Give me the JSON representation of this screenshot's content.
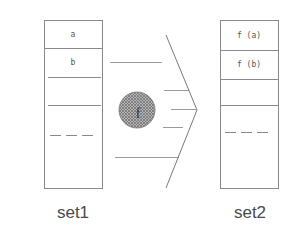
{
  "diagram": {
    "type": "function-mapping",
    "colors": {
      "line": "#8a8a8a",
      "text": "#4a4a4a",
      "circle_fill": "#9a9a9a",
      "background": "#ffffff"
    },
    "source_set": {
      "label": "set1",
      "cells": [
        "a",
        "b",
        "",
        "",
        "..."
      ]
    },
    "target_set": {
      "label": "set2",
      "cells": [
        "f (a)",
        "f (b)",
        "",
        "",
        "..."
      ]
    },
    "function": {
      "label": "f",
      "shape": "hatched-circle"
    },
    "arrow": {
      "shape": "chevron",
      "direction": "right"
    }
  }
}
